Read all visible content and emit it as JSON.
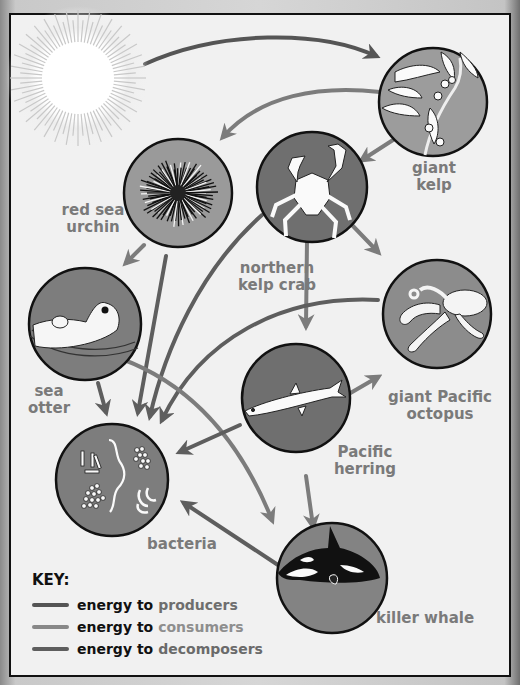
{
  "colors": {
    "producers_line": "#555555",
    "consumers_line": "#777777",
    "decomposers_line": "#5e5e5e",
    "circle_fill": "#7d7d7d",
    "label": "#7a7a7a"
  },
  "nodes": [
    {
      "id": "sun",
      "label": ""
    },
    {
      "id": "giant-kelp",
      "label_line1": "giant",
      "label_line2": "kelp"
    },
    {
      "id": "red-sea-urchin",
      "label_line1": "red sea",
      "label_line2": "urchin"
    },
    {
      "id": "northern-kelp-crab",
      "label_line1": "northern",
      "label_line2": "kelp crab"
    },
    {
      "id": "sea-otter",
      "label_line1": "sea",
      "label_line2": "otter"
    },
    {
      "id": "giant-pacific-octopus",
      "label_line1": "giant Pacific",
      "label_line2": "octopus"
    },
    {
      "id": "pacific-herring",
      "label_line1": "Pacific",
      "label_line2": "herring"
    },
    {
      "id": "bacteria",
      "label_line1": "bacteria"
    },
    {
      "id": "killer-whale",
      "label_line1": "killer whale"
    }
  ],
  "edges": [
    {
      "from": "sun",
      "to": "giant-kelp",
      "type": "producers"
    },
    {
      "from": "giant-kelp",
      "to": "red-sea-urchin",
      "type": "consumers"
    },
    {
      "from": "giant-kelp",
      "to": "northern-kelp-crab",
      "type": "consumers"
    },
    {
      "from": "red-sea-urchin",
      "to": "sea-otter",
      "type": "consumers"
    },
    {
      "from": "red-sea-urchin",
      "to": "bacteria",
      "type": "decomposers"
    },
    {
      "from": "northern-kelp-crab",
      "to": "giant-pacific-octopus",
      "type": "consumers"
    },
    {
      "from": "northern-kelp-crab",
      "to": "pacific-herring",
      "type": "consumers"
    },
    {
      "from": "northern-kelp-crab",
      "to": "bacteria",
      "type": "decomposers"
    },
    {
      "from": "sea-otter",
      "to": "bacteria",
      "type": "decomposers"
    },
    {
      "from": "sea-otter",
      "to": "killer-whale",
      "type": "consumers"
    },
    {
      "from": "giant-pacific-octopus",
      "to": "bacteria",
      "type": "decomposers"
    },
    {
      "from": "pacific-herring",
      "to": "giant-pacific-octopus",
      "type": "consumers"
    },
    {
      "from": "pacific-herring",
      "to": "bacteria",
      "type": "decomposers"
    },
    {
      "from": "pacific-herring",
      "to": "killer-whale",
      "type": "consumers"
    },
    {
      "from": "red-sea-urchin",
      "to": "killer-whale",
      "type": "consumers"
    },
    {
      "from": "killer-whale",
      "to": "bacteria",
      "type": "decomposers"
    }
  ],
  "key": {
    "title": "KEY:",
    "prefix": "energy to",
    "items": [
      {
        "label": "producers",
        "color": "#555555"
      },
      {
        "label": "consumers",
        "color": "#888888"
      },
      {
        "label": "decomposers",
        "color": "#5e5e5e"
      }
    ]
  }
}
